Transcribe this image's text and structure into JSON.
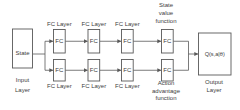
{
  "diagram": {
    "input": {
      "box_label": "State",
      "caption": [
        "Input",
        "Layer"
      ]
    },
    "fc_box_label": "FC",
    "fc_layer_caption": "FC Layer",
    "streams": {
      "top_caption": [
        "State",
        "value",
        "function"
      ],
      "bottom_caption": [
        "Action",
        "advantage",
        "function"
      ]
    },
    "output": {
      "box_label": "Q(s,a|θ)",
      "caption": [
        "Output",
        "Layer"
      ]
    },
    "colors": {
      "line": "#595959",
      "box_border": "#595959",
      "text": "#3d3d3d",
      "background": "#ffffff"
    }
  }
}
